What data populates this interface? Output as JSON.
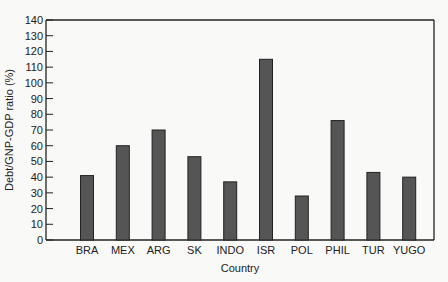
{
  "chart_data": {
    "type": "bar",
    "title": "",
    "xlabel": "Country",
    "ylabel": "Debt/GNP-GDP ratio (%)",
    "categories": [
      "BRA",
      "MEX",
      "ARG",
      "SK",
      "INDO",
      "ISR",
      "POL",
      "PHIL",
      "TUR",
      "YUGO"
    ],
    "values": [
      41,
      60,
      70,
      53,
      37,
      115,
      28,
      76,
      43,
      40
    ],
    "ylim": [
      0,
      140
    ],
    "yticks": [
      0,
      10,
      20,
      30,
      40,
      50,
      60,
      70,
      80,
      90,
      100,
      110,
      120,
      130,
      140
    ],
    "grid": false,
    "legend": null,
    "colors": {
      "bar": "#555555",
      "bar_edge": "#222222",
      "axis": "#222222",
      "background": "#f9f9f7"
    }
  }
}
